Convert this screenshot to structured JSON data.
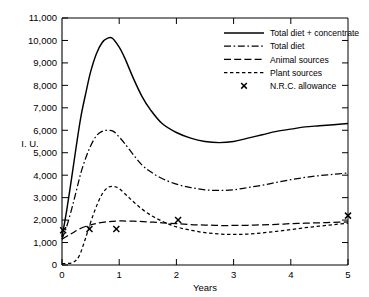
{
  "chart_data": {
    "type": "line",
    "title": "",
    "xlabel": "Years",
    "ylabel": "I. U.",
    "xlim": [
      0,
      5
    ],
    "ylim": [
      0,
      11000
    ],
    "grid": false,
    "legend_position": "top-right",
    "xticks": [
      "0",
      "1",
      "2",
      "3",
      "4",
      "5"
    ],
    "xtick_values": [
      0,
      1,
      2,
      3,
      4,
      5
    ],
    "yticks": [
      "0",
      "1,000",
      "2,000",
      "3,000",
      "4,000",
      "5,000",
      "6,000",
      "7,000",
      "8,000",
      "9,000",
      "10,000",
      "11,000"
    ],
    "ytick_values": [
      0,
      1000,
      2000,
      3000,
      4000,
      5000,
      6000,
      7000,
      8000,
      9000,
      10000,
      11000
    ],
    "series": [
      {
        "name": "Total diet + concentrate",
        "style": "solid",
        "x": [
          0.0,
          0.08,
          0.17,
          0.25,
          0.33,
          0.42,
          0.5,
          0.6,
          0.7,
          0.8,
          0.88,
          1.0,
          1.1,
          1.25,
          1.4,
          1.55,
          1.75,
          2.0,
          2.25,
          2.5,
          2.75,
          3.0,
          3.25,
          3.5,
          3.75,
          4.0,
          4.25,
          4.5,
          4.75,
          5.0
        ],
        "y": [
          1250,
          2400,
          3900,
          5300,
          6600,
          7700,
          8600,
          9400,
          9900,
          10100,
          10100,
          9700,
          9200,
          8300,
          7500,
          6900,
          6300,
          5900,
          5650,
          5500,
          5450,
          5500,
          5650,
          5800,
          5950,
          6050,
          6150,
          6200,
          6250,
          6300
        ]
      },
      {
        "name": "Total diet",
        "style": "dashdot",
        "x": [
          0.0,
          0.08,
          0.17,
          0.25,
          0.33,
          0.42,
          0.5,
          0.6,
          0.7,
          0.8,
          0.9,
          1.0,
          1.1,
          1.25,
          1.4,
          1.55,
          1.75,
          2.0,
          2.25,
          2.5,
          2.75,
          3.0,
          3.25,
          3.5,
          3.75,
          4.0,
          4.25,
          4.5,
          4.75,
          5.0
        ],
        "y": [
          1150,
          1700,
          2500,
          3300,
          4100,
          4800,
          5300,
          5750,
          5950,
          6000,
          5950,
          5700,
          5400,
          4900,
          4450,
          4150,
          3850,
          3600,
          3450,
          3350,
          3320,
          3350,
          3450,
          3550,
          3680,
          3800,
          3900,
          3980,
          4040,
          4100
        ]
      },
      {
        "name": "Animal sources",
        "style": "dashed-long",
        "x": [
          0.0,
          0.1,
          0.2,
          0.3,
          0.45,
          0.6,
          0.8,
          1.0,
          1.25,
          1.5,
          1.75,
          2.0,
          2.25,
          2.5,
          2.75,
          3.0,
          3.25,
          3.5,
          3.75,
          4.0,
          4.25,
          4.5,
          4.75,
          5.0
        ],
        "y": [
          1150,
          1300,
          1450,
          1600,
          1750,
          1850,
          1930,
          1960,
          1950,
          1920,
          1880,
          1840,
          1800,
          1780,
          1760,
          1760,
          1770,
          1790,
          1810,
          1840,
          1860,
          1880,
          1900,
          1920
        ]
      },
      {
        "name": "Plant sources",
        "style": "dashed-short",
        "x": [
          0.0,
          0.1,
          0.2,
          0.3,
          0.4,
          0.5,
          0.6,
          0.7,
          0.8,
          0.9,
          1.0,
          1.15,
          1.3,
          1.5,
          1.75,
          2.0,
          2.25,
          2.5,
          2.75,
          3.0,
          3.25,
          3.5,
          3.75,
          4.0,
          4.25,
          4.5,
          4.75,
          5.0
        ],
        "y": [
          60,
          70,
          120,
          400,
          1100,
          1900,
          2600,
          3150,
          3450,
          3500,
          3400,
          3050,
          2700,
          2300,
          1950,
          1700,
          1550,
          1440,
          1380,
          1360,
          1380,
          1430,
          1500,
          1580,
          1660,
          1730,
          1800,
          1860
        ]
      }
    ],
    "markers": {
      "name": "N.R.C. allowance",
      "symbol": "x",
      "points": [
        {
          "x": 0.02,
          "y": 1550
        },
        {
          "x": 0.48,
          "y": 1600
        },
        {
          "x": 0.95,
          "y": 1600
        },
        {
          "x": 2.03,
          "y": 2000
        },
        {
          "x": 5.0,
          "y": 2200
        }
      ]
    },
    "legend": [
      {
        "label": "Total diet + concentrate",
        "style": "solid"
      },
      {
        "label": "Total diet",
        "style": "dashdot"
      },
      {
        "label": "Animal sources",
        "style": "dashed-long"
      },
      {
        "label": "Plant sources",
        "style": "dashed-short"
      },
      {
        "label": "N.R.C. allowance",
        "style": "marker-x"
      }
    ]
  }
}
